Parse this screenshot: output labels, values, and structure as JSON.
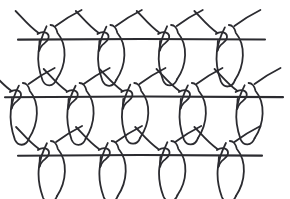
{
  "figure": {
    "width": 290,
    "height": 199,
    "background_color": "#ffffff",
    "stroke_color": "#2b2b30",
    "stroke_width": 1.8,
    "course_stroke_width": 2.1,
    "style": "hand-drawn line art"
  },
  "geometry": {
    "row_line_y": [
      39,
      97,
      155
    ],
    "row_spacing": 58,
    "stitch_pitch": 58,
    "loop_depth": 46,
    "loop_half_width": 13,
    "arm_rise": 26,
    "arm_reach": 30,
    "knot_width": 12,
    "knot_height": 11
  },
  "rows": [
    {
      "name": "course-row-1",
      "index": 0,
      "line_y": 39,
      "line_x_start": 18,
      "line_x_end": 265,
      "stitch_count": 4,
      "stitch_x": [
        50,
        110,
        170,
        228
      ]
    },
    {
      "name": "course-row-2",
      "index": 1,
      "line_y": 97,
      "line_x_start": 5,
      "line_x_end": 283,
      "stitch_count": 5,
      "stitch_x": [
        22,
        78,
        133,
        190,
        248
      ]
    },
    {
      "name": "course-row-3",
      "index": 2,
      "line_y": 155,
      "line_x_start": 18,
      "line_x_end": 262,
      "stitch_count": 4,
      "stitch_x": [
        50,
        110,
        170,
        228
      ]
    }
  ],
  "legend": {
    "course_label": "course line",
    "loop_label": "loop",
    "knot_label": "interlock knot",
    "arm_label": "connecting arm"
  }
}
